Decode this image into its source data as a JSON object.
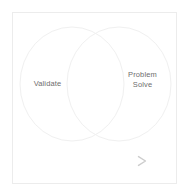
{
  "diagram": {
    "type": "venn-diagram",
    "title": "",
    "frame": {
      "border_color": "#ececec",
      "background_color": "#ffffff"
    },
    "circles": [
      {
        "id": "left-circle",
        "label": "Validate",
        "stroke_color": "#f0f0f0",
        "fill": "none",
        "cx": 72,
        "cy": 84,
        "rx": 52,
        "ry": 57
      },
      {
        "id": "right-circle",
        "label": "Problem\nSolve",
        "stroke_color": "#f0f0f0",
        "fill": "none",
        "cx": 119,
        "cy": 84,
        "rx": 52,
        "ry": 57
      }
    ],
    "labels": {
      "left": "Validate",
      "right": "Problem\nSolve",
      "text_color": "#6e6e6e"
    },
    "arrow": {
      "name": "right-arrow",
      "direction": "right",
      "x_start": 45,
      "x_end": 146,
      "y": 161,
      "color_start": "#fbfbfb",
      "color_end": "#cdcdcd"
    }
  }
}
